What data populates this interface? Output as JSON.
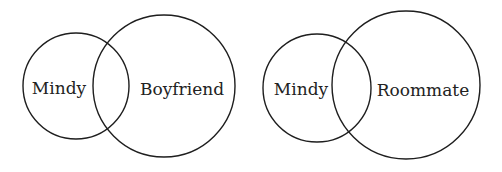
{
  "diagrams": [
    {
      "type": "venn",
      "sets": [
        {
          "label": "Mindy",
          "cx": 76,
          "cy": 86,
          "r": 53,
          "label_x": 59,
          "label_y": 94
        },
        {
          "label": "Boyfriend",
          "cx": 164,
          "cy": 86,
          "r": 71,
          "label_x": 182,
          "label_y": 95
        }
      ]
    },
    {
      "type": "venn",
      "sets": [
        {
          "label": "Mindy",
          "cx": 317,
          "cy": 88,
          "r": 54,
          "label_x": 301,
          "label_y": 95
        },
        {
          "label": "Roommate",
          "cx": 406,
          "cy": 85,
          "r": 74,
          "label_x": 423,
          "label_y": 96
        }
      ]
    }
  ],
  "colors": {
    "stroke": "#1e1e1e",
    "text": "#222222",
    "background": "#ffffff"
  }
}
